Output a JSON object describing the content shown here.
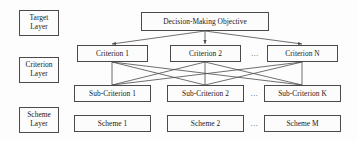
{
  "diagram": {
    "line_color": "#4a4a4a",
    "box_fill": "#fcfcfc",
    "text_color": "#1a1a1a",
    "background": "#fdfdfd",
    "ellipsis": "..."
  },
  "layers": [
    {
      "id": "target-layer",
      "line1": "Target",
      "line2": "Layer"
    },
    {
      "id": "criterion-layer",
      "line1": "Criterion",
      "line2": "Layer"
    },
    {
      "id": "scheme-layer",
      "line1": "Scheme",
      "line2": "Layer"
    }
  ],
  "target": {
    "label": "Decision-Making Objective"
  },
  "criteria": [
    {
      "label": "Criterion 1"
    },
    {
      "label": "Criterion 2"
    },
    {
      "label": "Criterion N"
    }
  ],
  "sub_criteria": [
    {
      "label": "Sub-Criterion 1"
    },
    {
      "label": "Sub-Criterion 2"
    },
    {
      "label": "Sub-Criterion K"
    }
  ],
  "schemes": [
    {
      "label": "Scheme 1"
    },
    {
      "label": "Scheme 2"
    },
    {
      "label": "Scheme M"
    }
  ],
  "ellipses": {
    "criterion_row": "...",
    "sub_criterion_row": "...",
    "scheme_row": "..."
  }
}
